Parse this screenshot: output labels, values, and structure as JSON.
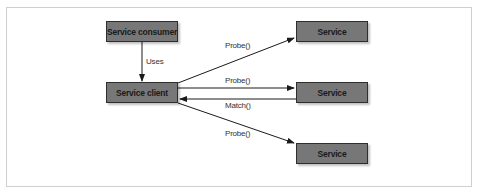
{
  "diagram": {
    "nodes": [
      {
        "id": "consumer",
        "label": "Service consumer"
      },
      {
        "id": "client",
        "label": "Service client"
      },
      {
        "id": "service1",
        "label": "Service"
      },
      {
        "id": "service2",
        "label": "Service"
      },
      {
        "id": "service3",
        "label": "Service"
      }
    ],
    "edges": [
      {
        "from": "consumer",
        "to": "client",
        "label": "Uses"
      },
      {
        "from": "client",
        "to": "service1",
        "label": "Probe()"
      },
      {
        "from": "client",
        "to": "service2",
        "label": "Probe()"
      },
      {
        "from": "service2",
        "to": "client",
        "label": "Match()"
      },
      {
        "from": "client",
        "to": "service3",
        "label": "Probe()"
      }
    ],
    "colors": {
      "node_fill": "#777777",
      "node_border": "#2e2e2e",
      "edge": "#1a1a1a",
      "frame_border": "#cfcfcf"
    }
  }
}
